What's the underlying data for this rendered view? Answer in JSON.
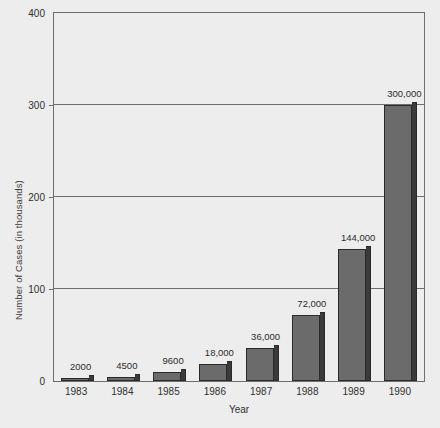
{
  "chart_data": {
    "type": "bar",
    "title": "",
    "xlabel": "Year",
    "ylabel": "Number of Cases (in thousands)",
    "categories": [
      "1983",
      "1984",
      "1985",
      "1986",
      "1987",
      "1988",
      "1989",
      "1990"
    ],
    "values": [
      2,
      4.5,
      9.6,
      18,
      36,
      72,
      144,
      300
    ],
    "value_labels": [
      "2000",
      "4500",
      "9600",
      "18,000",
      "36,000",
      "72,000",
      "144,000",
      "300,000"
    ],
    "ylim": [
      0,
      400
    ],
    "yticks": [
      0,
      100,
      200,
      300,
      400
    ],
    "ytick_labels": [
      "0",
      "100",
      "200",
      "300",
      "400"
    ],
    "grid": true,
    "legend": "none",
    "units_note": "bar values are in thousands of cases; printed labels show absolute case counts",
    "colors": {
      "background": "#ededed",
      "bar_face": "#6b6b6b",
      "bar_side": "#3a3a3a",
      "bar_outline": "#2a2a2a",
      "axis": "#6e6e6e",
      "text": "#303030"
    }
  }
}
